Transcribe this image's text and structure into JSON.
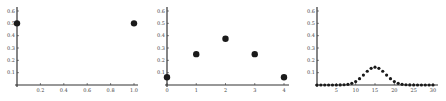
{
  "chart_data": [
    {
      "type": "scatter",
      "title": "",
      "xlabel": "",
      "ylabel": "",
      "x": [
        0,
        1
      ],
      "values": [
        0.5,
        0.5
      ],
      "xlim": [
        0,
        1.0
      ],
      "ylim": [
        0,
        0.6
      ],
      "x_ticks": [
        "0.2",
        "0.4",
        "0.6",
        "0.8",
        "1.0"
      ],
      "y_ticks": [
        "0.1",
        "0.2",
        "0.3",
        "0.4",
        "0.5",
        "0.6"
      ],
      "grid": false,
      "legend": null,
      "layout": {
        "x0": 17,
        "x1": 138,
        "y0": 85,
        "ytop": 7,
        "xmax_px": 134,
        "xmax_val": 1.0,
        "dot_r": 3.2
      }
    },
    {
      "type": "scatter",
      "title": "",
      "xlabel": "",
      "ylabel": "",
      "x": [
        0,
        1,
        2,
        3,
        4
      ],
      "values": [
        0.0625,
        0.25,
        0.375,
        0.25,
        0.0625
      ],
      "xlim": [
        0,
        4
      ],
      "ylim": [
        0,
        0.6
      ],
      "x_ticks": [
        "0",
        "1",
        "2",
        "3",
        "4"
      ],
      "y_ticks": [
        "0.1",
        "0.2",
        "0.3",
        "0.4",
        "0.5",
        "0.6"
      ],
      "grid": false,
      "legend": null,
      "layout": {
        "x0": 167,
        "x1": 289,
        "y0": 85,
        "ytop": 7,
        "xmax_px": 284,
        "xmax_val": 4,
        "dot_r": 3.2
      }
    },
    {
      "type": "scatter",
      "title": "",
      "xlabel": "",
      "ylabel": "",
      "x": [
        0,
        1,
        2,
        3,
        4,
        5,
        6,
        7,
        8,
        9,
        10,
        11,
        12,
        13,
        14,
        15,
        16,
        17,
        18,
        19,
        20,
        21,
        22,
        23,
        24,
        25,
        26,
        27,
        28,
        29,
        30
      ],
      "values": [
        0.0,
        0.0,
        0.0,
        0.0,
        0.0,
        0.0001,
        0.0006,
        0.0019,
        0.0055,
        0.0133,
        0.028,
        0.0509,
        0.0806,
        0.1115,
        0.1354,
        0.1445,
        0.1354,
        0.1115,
        0.0806,
        0.0509,
        0.028,
        0.0133,
        0.0055,
        0.0019,
        0.0006,
        0.0001,
        0.0,
        0.0,
        0.0,
        0.0,
        0.0
      ],
      "xlim": [
        0,
        30
      ],
      "ylim": [
        0,
        0.6
      ],
      "x_ticks": [
        "5",
        "10",
        "15",
        "20",
        "25",
        "30"
      ],
      "y_ticks": [
        "0.1",
        "0.2",
        "0.3",
        "0.4",
        "0.5",
        "0.6"
      ],
      "grid": false,
      "legend": null,
      "layout": {
        "x0": 317,
        "x1": 438,
        "y0": 85,
        "ytop": 7,
        "xmax_px": 433,
        "xmax_val": 30,
        "dot_r": 1.6
      }
    }
  ]
}
